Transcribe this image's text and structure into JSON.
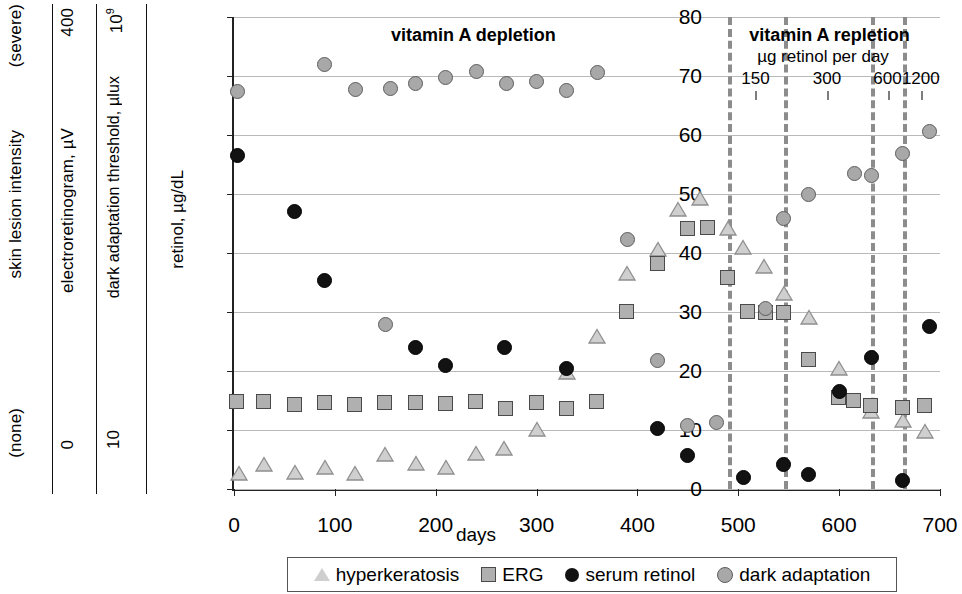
{
  "left_axes": [
    {
      "name": "skin-lesion-intensity",
      "title": "skin lesion intensity",
      "top_label": "(severe)",
      "bottom_label": "(none)"
    },
    {
      "name": "electroretinogram",
      "title": "electroretinogram, µV",
      "top_label": "400",
      "bottom_label": "0"
    },
    {
      "name": "dark-adaptation-threshold",
      "title": "dark adaptation threshold, µlux",
      "top_label": "10",
      "top_label_sup": "9",
      "bottom_label": "10"
    }
  ],
  "annotations": {
    "depletion_label": "vitamin A depletion",
    "repletion_label": "vitamin A repletion",
    "repletion_sublabel": "µg retinol per day",
    "doses": [
      {
        "label": "150",
        "day": 517
      },
      {
        "label": "300",
        "day": 588
      },
      {
        "label": "600",
        "day": 648
      },
      {
        "label": "1200",
        "day": 681
      }
    ],
    "dividers_days": [
      490,
      545,
      632,
      663
    ]
  },
  "legend": {
    "items": [
      {
        "key": "hyperkeratosis",
        "label": "hyperkeratosis",
        "marker": "triangle-icon",
        "color": "#cfcfcf"
      },
      {
        "key": "erg",
        "label": "ERG",
        "marker": "square-icon",
        "color": "#b0b0b0"
      },
      {
        "key": "serum_retinol",
        "label": "serum retinol",
        "marker": "filled-circle-icon",
        "color": "#121212"
      },
      {
        "key": "dark_adaptation",
        "label": "dark adaptation",
        "marker": "grey-circle-icon",
        "color": "#a8a8a8"
      }
    ]
  },
  "chart_data": {
    "type": "scatter",
    "title": "",
    "xlabel": "days",
    "ylabel": "retinol, µg/dL",
    "xlim": [
      0,
      700
    ],
    "ylim": [
      0,
      80
    ],
    "xticks": [
      0,
      100,
      200,
      300,
      400,
      500,
      600,
      700
    ],
    "yticks": [
      0,
      10,
      20,
      30,
      40,
      50,
      60,
      70,
      80
    ],
    "grid": "horizontal",
    "legend_position": "bottom",
    "series": [
      {
        "name": "hyperkeratosis",
        "marker": "triangle",
        "color": "#cfcfcf",
        "points": [
          [
            5,
            2.6
          ],
          [
            30,
            4.1
          ],
          [
            60,
            2.7
          ],
          [
            90,
            3.5
          ],
          [
            120,
            2.5
          ],
          [
            150,
            5.8
          ],
          [
            180,
            4.2
          ],
          [
            210,
            3.6
          ],
          [
            240,
            5.9
          ],
          [
            268,
            6.8
          ],
          [
            300,
            10.0
          ],
          [
            330,
            19.7
          ],
          [
            360,
            25.7
          ],
          [
            390,
            36.5
          ],
          [
            420,
            40.5
          ],
          [
            440,
            47.3
          ],
          [
            462,
            49.1
          ],
          [
            490,
            44.0
          ],
          [
            505,
            40.8
          ],
          [
            525,
            37.6
          ],
          [
            545,
            33.0
          ],
          [
            570,
            29.0
          ],
          [
            600,
            20.3
          ],
          [
            632,
            13.0
          ],
          [
            663,
            11.5
          ],
          [
            685,
            9.7
          ]
        ]
      },
      {
        "name": "ERG",
        "marker": "square",
        "color": "#b0b0b0",
        "points": [
          [
            3,
            14.8
          ],
          [
            30,
            14.8
          ],
          [
            60,
            14.2
          ],
          [
            90,
            14.6
          ],
          [
            120,
            14.2
          ],
          [
            150,
            14.5
          ],
          [
            180,
            14.5
          ],
          [
            210,
            14.4
          ],
          [
            240,
            14.8
          ],
          [
            270,
            13.6
          ],
          [
            300,
            14.6
          ],
          [
            330,
            13.5
          ],
          [
            360,
            14.8
          ],
          [
            390,
            30.0
          ],
          [
            420,
            38.2
          ],
          [
            450,
            44.0
          ],
          [
            470,
            44.2
          ],
          [
            490,
            35.8
          ],
          [
            510,
            30.0
          ],
          [
            527,
            29.8
          ],
          [
            545,
            29.8
          ],
          [
            570,
            21.8
          ],
          [
            600,
            15.4
          ],
          [
            615,
            15.0
          ],
          [
            632,
            14.0
          ],
          [
            663,
            13.7
          ],
          [
            685,
            14.0
          ]
        ]
      },
      {
        "name": "serum retinol",
        "marker": "filled-circle",
        "color": "#121212",
        "points": [
          [
            3,
            56.6
          ],
          [
            60,
            47.0
          ],
          [
            90,
            35.4
          ],
          [
            180,
            24.0
          ],
          [
            210,
            21.0
          ],
          [
            268,
            24.0
          ],
          [
            330,
            20.5
          ],
          [
            420,
            10.2
          ],
          [
            450,
            5.7
          ],
          [
            505,
            1.9
          ],
          [
            545,
            4.1
          ],
          [
            570,
            2.4
          ],
          [
            600,
            16.6
          ],
          [
            632,
            22.3
          ],
          [
            663,
            1.4
          ],
          [
            690,
            27.6
          ]
        ]
      },
      {
        "name": "dark adaptation",
        "marker": "grey-circle",
        "color": "#a8a8a8",
        "points": [
          [
            3,
            67.3
          ],
          [
            90,
            71.9
          ],
          [
            120,
            67.7
          ],
          [
            150,
            27.8
          ],
          [
            155,
            67.8
          ],
          [
            180,
            68.8
          ],
          [
            210,
            69.8
          ],
          [
            240,
            70.7
          ],
          [
            270,
            68.7
          ],
          [
            300,
            69.1
          ],
          [
            330,
            67.6
          ],
          [
            360,
            70.6
          ],
          [
            390,
            42.3
          ],
          [
            420,
            21.8
          ],
          [
            450,
            10.8
          ],
          [
            478,
            11.2
          ],
          [
            527,
            30.6
          ],
          [
            545,
            45.8
          ],
          [
            570,
            49.9
          ],
          [
            615,
            53.5
          ],
          [
            632,
            53.2
          ],
          [
            663,
            56.8
          ],
          [
            690,
            60.6
          ]
        ]
      }
    ]
  }
}
